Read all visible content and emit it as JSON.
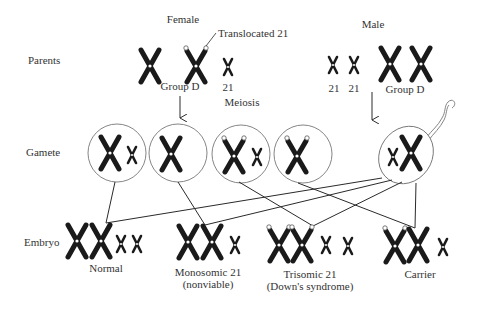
{
  "rows": {
    "parents": "Parents",
    "gamete": "Gamete",
    "embryo": "Embryo"
  },
  "parents": {
    "female": {
      "label": "Female",
      "annotation": "Translocated 21",
      "group_label": "Group D",
      "small_label": "21"
    },
    "male": {
      "label": "Male",
      "small_labels": [
        "21",
        "21"
      ],
      "group_label": "Group D"
    }
  },
  "process": {
    "meiosis": "Meiosis"
  },
  "gametes": [
    {
      "id": "egg-1",
      "contents": "Group D + 21"
    },
    {
      "id": "egg-2",
      "contents": "Group D"
    },
    {
      "id": "egg-3",
      "contents": "Translocated 21 + 21"
    },
    {
      "id": "egg-4",
      "contents": "Translocated 21"
    },
    {
      "id": "sperm",
      "contents": "21 + Group D"
    }
  ],
  "embryos": [
    {
      "label": "Normal",
      "sublabel": ""
    },
    {
      "label": "Monosomic 21",
      "sublabel": "(nonviable)"
    },
    {
      "label": "Trisomic 21",
      "sublabel": "(Down's syndrome)"
    },
    {
      "label": "Carrier",
      "sublabel": ""
    }
  ],
  "colors": {
    "chromosome": "#1a1a1a",
    "line": "#2a2a2a",
    "circle": "#777777",
    "text": "#333333"
  }
}
